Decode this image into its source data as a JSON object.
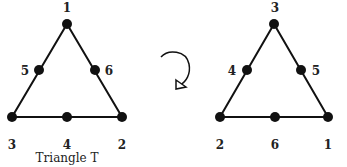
{
  "diagram": {
    "left_triangle": {
      "caption": "Triangle T",
      "vertices": {
        "top": "1",
        "bottom_right": "2",
        "bottom_left": "3"
      },
      "midpoints": {
        "bottom": "4",
        "left": "5",
        "right": "6"
      }
    },
    "rotation_symbol": "clockwise-rotation-arrow",
    "right_triangle": {
      "vertices": {
        "top": "3",
        "bottom_right": "1",
        "bottom_left": "2"
      },
      "midpoints": {
        "bottom": "6",
        "left": "4",
        "right": "5"
      }
    },
    "colors": {
      "stroke": "#111111",
      "text": "#222222",
      "background": "#ffffff"
    }
  }
}
